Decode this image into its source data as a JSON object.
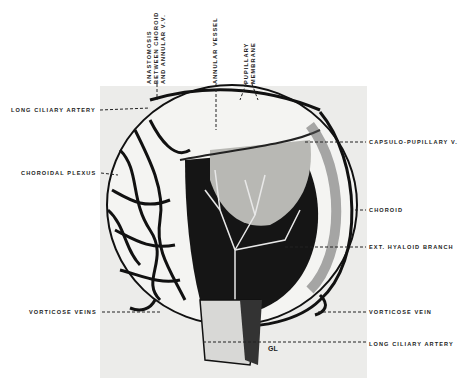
{
  "figure": {
    "type": "anatomical-illustration",
    "labels_top": [
      {
        "lines": [
          "ANASTOMOSIS",
          "BETWEEN CHOROID",
          "AND ANNULAR V.V."
        ]
      },
      {
        "lines": [
          "ANNULAR VESSEL"
        ]
      },
      {
        "lines": [
          "PUPILLARY",
          "MEMBRANE"
        ]
      }
    ],
    "labels_left": [
      {
        "text": "LONG CILIARY ARTERY"
      },
      {
        "text": "CHOROIDAL PLEXUS"
      },
      {
        "text": "VORTICOSE VEINS"
      }
    ],
    "labels_right": [
      {
        "text": "CAPSULO-PUPILLARY V."
      },
      {
        "text": "CHOROID"
      },
      {
        "text": "EXT. HYALOID BRANCH"
      },
      {
        "text": "VORTICOSE VEIN"
      },
      {
        "text": "LONG CILIARY ARTERY"
      }
    ],
    "inline_label": "GL"
  }
}
